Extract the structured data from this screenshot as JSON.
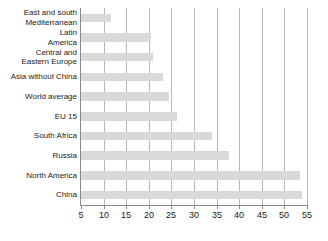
{
  "chart_data": {
    "type": "bar",
    "orientation": "horizontal",
    "title": "",
    "subtitle": "",
    "xlabel": "",
    "ylabel": "",
    "xlim": [
      5,
      55
    ],
    "ylim": null,
    "grid": "vertical",
    "legend": "none",
    "bar_color": "#d9d9d9",
    "axis_color": "#8a8a8a",
    "gridline_color": "#b8b8b8",
    "xticks": [
      5,
      10,
      15,
      20,
      25,
      30,
      35,
      40,
      45,
      50,
      55
    ],
    "xticklabels": [
      "5",
      "10",
      "15",
      "20",
      "25",
      "30",
      "35",
      "40",
      "45",
      "50",
      "55"
    ],
    "categories": [
      "East and south Mediterranean",
      "Latin America",
      "Central and Eastern Europe",
      "Asia without China",
      "World average",
      "EU 15",
      "South Africa",
      "Russia",
      "North America",
      "China"
    ],
    "category_label_lines": [
      [
        "East and south",
        "Mediterranean"
      ],
      [
        "Latin",
        "America"
      ],
      [
        "Central and",
        "Eastern Europe"
      ],
      [
        "Asia without China"
      ],
      [
        "World average"
      ],
      [
        "EU 15"
      ],
      [
        "South Africa"
      ],
      [
        "Russia"
      ],
      [
        "North America"
      ],
      [
        "China"
      ]
    ],
    "values": [
      11.7,
      20.4,
      21.0,
      23.2,
      24.5,
      26.3,
      34.0,
      37.8,
      53.5,
      53.8
    ]
  }
}
